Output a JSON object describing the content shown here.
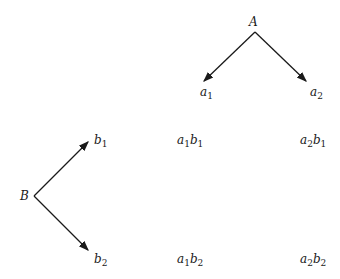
{
  "diagram": {
    "factor_a": {
      "label": "A",
      "levels": [
        {
          "base": "a",
          "sub": "1"
        },
        {
          "base": "a",
          "sub": "2"
        }
      ]
    },
    "factor_b": {
      "label": "B",
      "levels": [
        {
          "base": "b",
          "sub": "1"
        },
        {
          "base": "b",
          "sub": "2"
        }
      ]
    },
    "combinations": [
      {
        "a": "a",
        "a_sub": "1",
        "b": "b",
        "b_sub": "1"
      },
      {
        "a": "a",
        "a_sub": "2",
        "b": "b",
        "b_sub": "1"
      },
      {
        "a": "a",
        "a_sub": "1",
        "b": "b",
        "b_sub": "2"
      },
      {
        "a": "a",
        "a_sub": "2",
        "b": "b",
        "b_sub": "2"
      }
    ]
  }
}
